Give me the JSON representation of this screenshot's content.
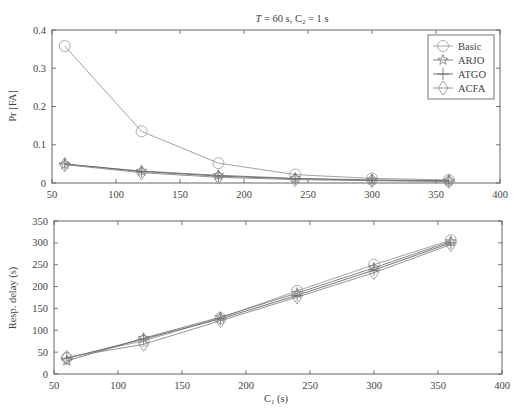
{
  "chart_data": [
    {
      "type": "line",
      "title": "T = 60 s, C2 = 1 s",
      "title_parts": {
        "T": "T",
        "eq1": " = 60 s, ",
        "C": "C",
        "sub": "2",
        "eq2": " = 1 s"
      },
      "xlabel": "",
      "ylabel": "Pr [FA]",
      "xlim": [
        50,
        400
      ],
      "ylim": [
        0,
        0.4
      ],
      "xticks": [
        50,
        100,
        150,
        200,
        250,
        300,
        350,
        400
      ],
      "yticks": [
        0,
        0.1,
        0.2,
        0.3,
        0.4
      ],
      "ytick_labels": [
        "0",
        "0.1",
        "0.2",
        "0.3",
        "0.4"
      ],
      "grid": false,
      "legend_position": "upper right",
      "x": [
        60,
        120,
        180,
        240,
        300,
        360
      ],
      "series": [
        {
          "name": "Basic",
          "marker": "circle",
          "values": [
            0.358,
            0.135,
            0.052,
            0.022,
            0.012,
            0.008
          ]
        },
        {
          "name": "ARJO",
          "marker": "star",
          "values": [
            0.049,
            0.031,
            0.02,
            0.012,
            0.008,
            0.006
          ]
        },
        {
          "name": "ATGO",
          "marker": "plus",
          "values": [
            0.05,
            0.03,
            0.018,
            0.011,
            0.007,
            0.005
          ]
        },
        {
          "name": "ACFA",
          "marker": "diamond",
          "values": [
            0.048,
            0.027,
            0.015,
            0.009,
            0.006,
            0.004
          ]
        }
      ]
    },
    {
      "type": "line",
      "title": "",
      "xlabel": "C1 (s)",
      "xlabel_parts": {
        "C": "C",
        "sub": "1",
        "rest": " (s)"
      },
      "ylabel": "Resp. delay (s)",
      "xlim": [
        50,
        400
      ],
      "ylim": [
        0,
        350
      ],
      "xticks": [
        50,
        100,
        150,
        200,
        250,
        300,
        350,
        400
      ],
      "yticks": [
        0,
        50,
        100,
        150,
        200,
        250,
        300,
        350
      ],
      "grid": false,
      "x": [
        60,
        120,
        180,
        240,
        300,
        360
      ],
      "series": [
        {
          "name": "Basic",
          "marker": "circle",
          "values": [
            37,
            76,
            128,
            190,
            250,
            306
          ]
        },
        {
          "name": "ARJO",
          "marker": "star",
          "values": [
            30,
            82,
            130,
            185,
            243,
            303
          ]
        },
        {
          "name": "ATGO",
          "marker": "plus",
          "values": [
            36,
            80,
            126,
            180,
            238,
            300
          ]
        },
        {
          "name": "ACFA",
          "marker": "diamond",
          "values": [
            38,
            68,
            122,
            176,
            232,
            296
          ]
        }
      ]
    }
  ],
  "legend": {
    "items": [
      "Basic",
      "ARJO",
      "ATGO",
      "ACFA"
    ]
  }
}
